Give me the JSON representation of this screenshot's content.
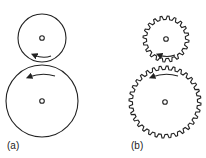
{
  "panels": [
    {
      "label": "(a)",
      "type": "friction-wheels",
      "small": {
        "cx": 42,
        "cy": 38,
        "r": 24
      },
      "large": {
        "cx": 42,
        "cy": 101,
        "r": 36
      }
    },
    {
      "label": "(b)",
      "type": "spur-gears",
      "small": {
        "cx": 166,
        "cy": 39,
        "r": 21,
        "teeth": 20
      },
      "large": {
        "cx": 165,
        "cy": 102,
        "r": 34,
        "teeth": 32
      }
    }
  ],
  "colors": {
    "stroke": "#222222",
    "background": "#ffffff"
  }
}
